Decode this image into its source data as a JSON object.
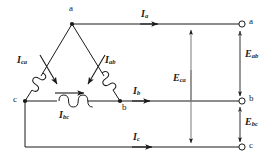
{
  "diagram": {
    "type": "electrical-schematic",
    "colors": {
      "line": "#1a1a1a",
      "background": "#ffffff",
      "text": "#1a1a1a"
    },
    "delta_nodes": [
      {
        "id": "a",
        "label": "a",
        "x": 72,
        "y": 24
      },
      {
        "id": "b",
        "label": "b",
        "x": 120,
        "y": 101
      },
      {
        "id": "c",
        "label": "c",
        "x": 25,
        "y": 101
      }
    ],
    "phase_currents": [
      {
        "id": "I_ca",
        "base": "I",
        "sub": "ca",
        "label": "Ica"
      },
      {
        "id": "I_ab",
        "base": "I",
        "sub": "ab",
        "label": "Iab"
      },
      {
        "id": "I_bc",
        "base": "I",
        "sub": "bc",
        "label": "Ibc"
      }
    ],
    "line_currents": [
      {
        "id": "I_a",
        "base": "I",
        "sub": "a",
        "label": "Ia"
      },
      {
        "id": "I_b",
        "base": "I",
        "sub": "b",
        "label": "Ib"
      },
      {
        "id": "I_c",
        "base": "I",
        "sub": "c",
        "label": "Ic"
      }
    ],
    "voltages": [
      {
        "id": "E_ab",
        "base": "E",
        "sub": "ab",
        "label": "Eab"
      },
      {
        "id": "E_bc",
        "base": "E",
        "sub": "bc",
        "label": "Ebc"
      },
      {
        "id": "E_ca",
        "base": "E",
        "sub": "ca",
        "label": "Eca"
      }
    ],
    "terminals": [
      {
        "id": "term-a",
        "label": "a",
        "x": 242,
        "y": 24
      },
      {
        "id": "term-b",
        "label": "b",
        "x": 242,
        "y": 101
      },
      {
        "id": "term-c",
        "label": "c",
        "x": 242,
        "y": 147
      }
    ]
  }
}
